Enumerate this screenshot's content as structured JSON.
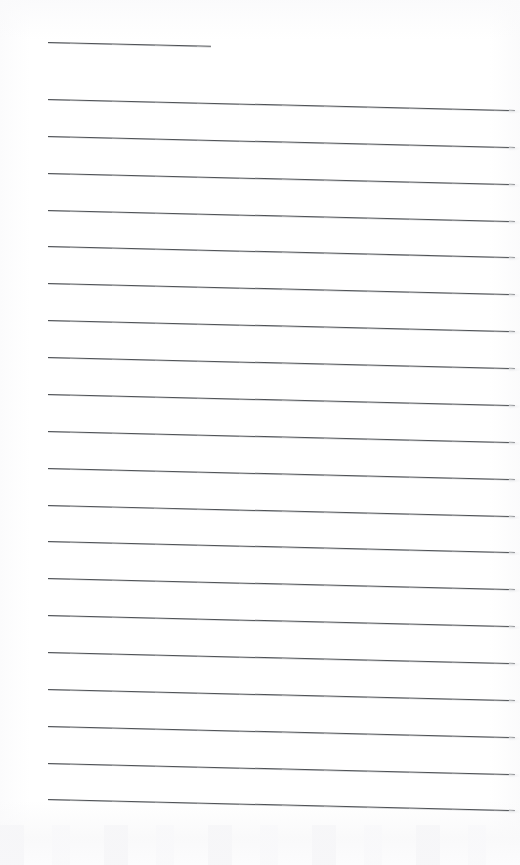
{
  "page": {
    "width": 520,
    "height": 865,
    "background_color": "#ffffff",
    "content_text": ""
  },
  "ruling": {
    "line_color": "#4d5054",
    "line_thickness_px": 1.15,
    "left_margin_px": 48,
    "right_edge_px": 515,
    "skew_drop_px": 11,
    "count_total": 21,
    "count_full_width": 20,
    "count_short": 1,
    "spacing_px": 36.85,
    "first_line_y_px": 42,
    "first_full_line_y_px": 99,
    "last_line_y_px": 805,
    "lines": [
      {
        "index": 1,
        "y": 42,
        "x_start": 48,
        "x_end": 211,
        "kind": "short"
      },
      {
        "index": 2,
        "y": 99,
        "x_start": 48,
        "x_end": 515,
        "kind": "full"
      },
      {
        "index": 3,
        "y": 135.9,
        "x_start": 48,
        "x_end": 515,
        "kind": "full"
      },
      {
        "index": 4,
        "y": 172.7,
        "x_start": 48,
        "x_end": 515,
        "kind": "full"
      },
      {
        "index": 5,
        "y": 209.6,
        "x_start": 48,
        "x_end": 515,
        "kind": "full"
      },
      {
        "index": 6,
        "y": 246.4,
        "x_start": 48,
        "x_end": 515,
        "kind": "full"
      },
      {
        "index": 7,
        "y": 283.3,
        "x_start": 48,
        "x_end": 515,
        "kind": "full"
      },
      {
        "index": 8,
        "y": 320.2,
        "x_start": 48,
        "x_end": 515,
        "kind": "full"
      },
      {
        "index": 9,
        "y": 357.0,
        "x_start": 48,
        "x_end": 515,
        "kind": "full"
      },
      {
        "index": 10,
        "y": 393.9,
        "x_start": 48,
        "x_end": 515,
        "kind": "full"
      },
      {
        "index": 11,
        "y": 430.7,
        "x_start": 48,
        "x_end": 515,
        "kind": "full"
      },
      {
        "index": 12,
        "y": 467.6,
        "x_start": 48,
        "x_end": 515,
        "kind": "full"
      },
      {
        "index": 13,
        "y": 504.5,
        "x_start": 48,
        "x_end": 515,
        "kind": "full"
      },
      {
        "index": 14,
        "y": 541.3,
        "x_start": 48,
        "x_end": 515,
        "kind": "full"
      },
      {
        "index": 15,
        "y": 578.2,
        "x_start": 48,
        "x_end": 515,
        "kind": "full"
      },
      {
        "index": 16,
        "y": 615.0,
        "x_start": 48,
        "x_end": 515,
        "kind": "full"
      },
      {
        "index": 17,
        "y": 651.9,
        "x_start": 48,
        "x_end": 515,
        "kind": "full"
      },
      {
        "index": 18,
        "y": 688.8,
        "x_start": 48,
        "x_end": 515,
        "kind": "full"
      },
      {
        "index": 19,
        "y": 725.6,
        "x_start": 48,
        "x_end": 515,
        "kind": "full"
      },
      {
        "index": 20,
        "y": 762.5,
        "x_start": 48,
        "x_end": 515,
        "kind": "full"
      },
      {
        "index": 21,
        "y": 799.3,
        "x_start": 48,
        "x_end": 515,
        "kind": "full"
      }
    ]
  }
}
